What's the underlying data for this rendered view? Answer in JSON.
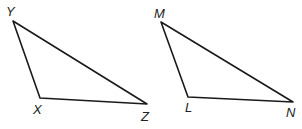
{
  "diagram": {
    "triangles": [
      {
        "name": "XYZ",
        "vertices": [
          {
            "label": "Y",
            "x": 13,
            "y": 21,
            "lx": 6,
            "ly": 16
          },
          {
            "label": "X",
            "x": 40,
            "y": 98,
            "lx": 33,
            "ly": 114
          },
          {
            "label": "Z",
            "x": 147,
            "y": 104,
            "lx": 141,
            "ly": 121
          }
        ]
      },
      {
        "name": "LMN",
        "vertices": [
          {
            "label": "M",
            "x": 161,
            "y": 22,
            "lx": 154,
            "ly": 18
          },
          {
            "label": "L",
            "x": 188,
            "y": 97,
            "lx": 185,
            "ly": 112
          },
          {
            "label": "N",
            "x": 293,
            "y": 102,
            "lx": 286,
            "ly": 117
          }
        ]
      }
    ],
    "stroke_color": "#1a1a1a"
  }
}
